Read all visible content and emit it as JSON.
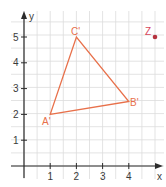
{
  "chart_data": {
    "type": "scatter",
    "title": "",
    "xlabel": "x",
    "ylabel": "y",
    "xlim": [
      -0.5,
      5.2
    ],
    "ylim": [
      -0.5,
      6.0
    ],
    "grid": true,
    "grid_step": 0.5,
    "x_ticks": [
      "1",
      "2",
      "3",
      "4"
    ],
    "y_ticks": [
      "1",
      "2",
      "3",
      "4",
      "5"
    ],
    "triangle": {
      "color": "#e8704a",
      "vertices": [
        {
          "label": "A'",
          "x": 1,
          "y": 2
        },
        {
          "label": "B'",
          "x": 4,
          "y": 2.5
        },
        {
          "label": "C'",
          "x": 2,
          "y": 5
        }
      ]
    },
    "points": [
      {
        "label": "Z",
        "x": 4.9,
        "y": 5,
        "color": "#b5333f",
        "label_color": "#d9475a"
      }
    ]
  }
}
